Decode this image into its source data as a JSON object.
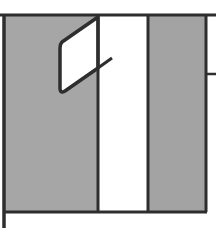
{
  "figure": {
    "colors": {
      "background": "#ffffff",
      "panel_fill": "#a6a6a6",
      "outline": "#2e2e2e",
      "glyph_fill": "#ffffff"
    },
    "glyph": "1"
  }
}
